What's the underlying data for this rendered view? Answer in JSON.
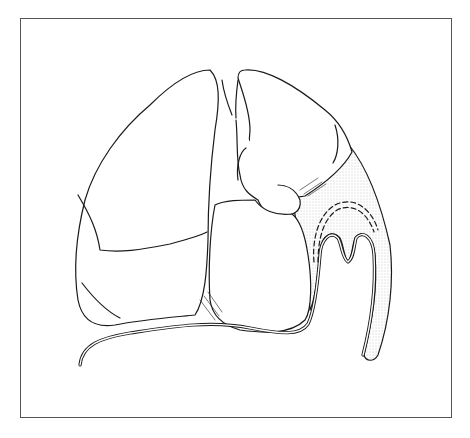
{
  "figure": {
    "colors": {
      "line": "#1a1a1a",
      "stipple": "#9a9a9a",
      "frame": "#555555",
      "background": "#ffffff"
    }
  }
}
